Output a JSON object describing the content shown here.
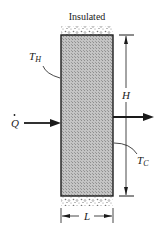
{
  "diagram": {
    "title_label": "Insulated",
    "labels": {
      "heat_flow": "Q",
      "hot_temp": "T",
      "hot_sub": "H",
      "cold_temp": "T",
      "cold_sub": "C",
      "height": "H",
      "length": "L"
    },
    "colors": {
      "slab_fill": "#b8b8b8",
      "line": "#1a1a1a",
      "insulation": "#8a8a8a"
    }
  }
}
